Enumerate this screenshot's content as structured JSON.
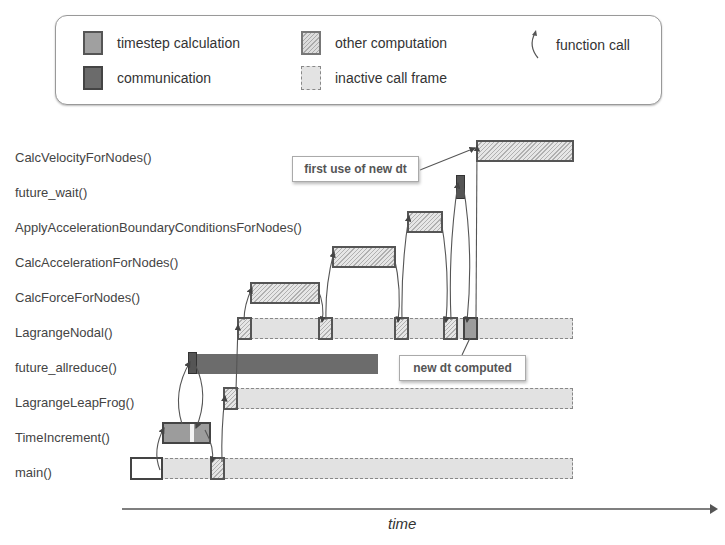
{
  "legend": {
    "items": [
      {
        "label": "timestep calculation",
        "swatch": "timestep",
        "color": "#a0a0a0"
      },
      {
        "label": "other computation",
        "swatch": "hatched",
        "color": "#cccccc"
      },
      {
        "label": "function call",
        "swatch": "curved-arrow-icon"
      },
      {
        "label": "communication",
        "swatch": "communication",
        "color": "#6b6b6b"
      },
      {
        "label": "inactive call frame",
        "swatch": "inactive",
        "color": "#e3e3e3"
      }
    ]
  },
  "rows": [
    {
      "label": "CalcVelocityForNodes()",
      "y": 157
    },
    {
      "label": "future_wait()",
      "y": 192
    },
    {
      "label": "ApplyAccelerationBoundaryConditionsForNodes()",
      "y": 227
    },
    {
      "label": "CalcAccelerationForNodes()",
      "y": 262
    },
    {
      "label": "CalcForceForNodes()",
      "y": 297
    },
    {
      "label": "LagrangeNodal()",
      "y": 332
    },
    {
      "label": "future_allreduce()",
      "y": 367
    },
    {
      "label": "LagrangeLeapFrog()",
      "y": 402
    },
    {
      "label": "TimeIncrement()",
      "y": 437
    },
    {
      "label": "main()",
      "y": 472
    }
  ],
  "annotations": {
    "first_use": "first use of new dt",
    "new_dt": "new dt computed"
  },
  "axis": {
    "label": "time"
  }
}
